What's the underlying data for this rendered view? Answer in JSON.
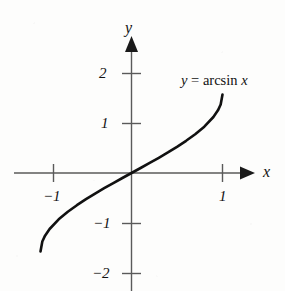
{
  "figure": {
    "title": "",
    "background_color": "#fdfdfc",
    "curve_color": "#111111",
    "axis_color": "#5a5a5a"
  },
  "axes": {
    "x_axis_label": "x",
    "y_axis_label": "y",
    "x_ticks": [
      {
        "label": "−1",
        "value": -1
      },
      {
        "label": "1",
        "value": 1
      }
    ],
    "y_ticks": [
      {
        "label": "2",
        "value": 2
      },
      {
        "label": "1",
        "value": 1
      },
      {
        "label": "−1",
        "value": -1
      },
      {
        "label": "−2",
        "value": -2
      }
    ]
  },
  "annotations": {
    "equation_y": "y",
    "equation_eq": "=",
    "equation_fn": "arcsin",
    "equation_x": "x"
  },
  "chart_data": {
    "type": "line",
    "title": "",
    "xlabel": "x",
    "ylabel": "y",
    "grid": false,
    "legend": null,
    "xlim": [
      -1.28,
      1.68
    ],
    "ylim": [
      -2.38,
      2.38
    ],
    "xticks": [
      -1,
      1
    ],
    "xticklabels": [
      "−1",
      "1"
    ],
    "yticks": [
      2,
      1,
      -1,
      -2
    ],
    "yticklabels": [
      "2",
      "1",
      "−1",
      "−2"
    ],
    "annotations": [
      {
        "text": "y = arcsin x",
        "x": 0.6,
        "y": 1.95
      }
    ],
    "series": [
      {
        "name": "y = arcsin x",
        "x": [
          -1,
          -0.98,
          -0.95,
          -0.9,
          -0.8,
          -0.7,
          -0.6,
          -0.5,
          -0.4,
          -0.3,
          -0.2,
          -0.1,
          0,
          0.1,
          0.2,
          0.3,
          0.4,
          0.5,
          0.6,
          0.7,
          0.8,
          0.9,
          0.95,
          0.98,
          1
        ],
        "y": [
          -1.5708,
          -1.3705,
          -1.2532,
          -1.1198,
          -0.9273,
          -0.7754,
          -0.6435,
          -0.5236,
          -0.4115,
          -0.3047,
          -0.2014,
          -0.1002,
          0,
          0.1002,
          0.2014,
          0.3047,
          0.4115,
          0.5236,
          0.6435,
          0.7754,
          0.9273,
          1.1198,
          1.2532,
          1.3705,
          1.5708
        ]
      }
    ]
  }
}
